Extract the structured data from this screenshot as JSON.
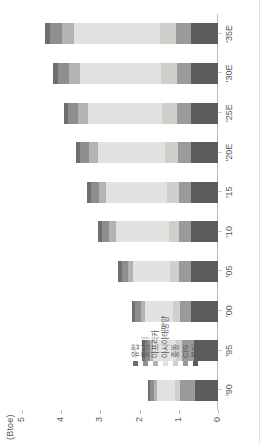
{
  "axis": {
    "unit_label": "(Btoe)",
    "y_ticks": [
      "5",
      "4",
      "3",
      "2",
      "1",
      "0"
    ],
    "y_min": 0,
    "y_max": 5
  },
  "legend": {
    "items": [
      {
        "label": "유럽",
        "color": "#6f6f71"
      },
      {
        "label": "중남미",
        "color": "#8e8e90"
      },
      {
        "label": "아프리카",
        "color": "#b3b3b5"
      },
      {
        "label": "아시아태평양",
        "color": "#e2e2e0"
      },
      {
        "label": "중동",
        "color": "#cfcfcb"
      },
      {
        "label": "CIS",
        "color": "#9a9a9c"
      },
      {
        "label": "북미",
        "color": "#5c5c5e"
      }
    ]
  },
  "chart_data": {
    "type": "bar",
    "title": "",
    "subtitle": "",
    "xlabel": "",
    "ylabel": "(Btoe)",
    "ylim": [
      0,
      5
    ],
    "grid": false,
    "stacked": true,
    "legend_position": "inside-left",
    "categories": [
      "'90",
      "'95",
      "'00",
      "'05",
      "'10",
      "'15",
      "'20E",
      "'25E",
      "'30E",
      "'35E"
    ],
    "series": [
      {
        "name": "북미",
        "color": "#5c5c5e",
        "values": [
          0.58,
          0.62,
          0.68,
          0.7,
          0.68,
          0.68,
          0.68,
          0.7,
          0.7,
          0.7
        ]
      },
      {
        "name": "CIS",
        "color": "#9a9a9c",
        "values": [
          0.4,
          0.3,
          0.28,
          0.3,
          0.31,
          0.32,
          0.33,
          0.34,
          0.35,
          0.36
        ]
      },
      {
        "name": "중동",
        "color": "#cfcfcb",
        "values": [
          0.12,
          0.15,
          0.18,
          0.22,
          0.27,
          0.31,
          0.34,
          0.38,
          0.41,
          0.43
        ]
      },
      {
        "name": "아시아태평양",
        "color": "#e2e2e0",
        "values": [
          0.45,
          0.58,
          0.72,
          0.95,
          1.35,
          1.55,
          1.72,
          1.9,
          2.05,
          2.18
        ]
      },
      {
        "name": "아프리카",
        "color": "#b3b3b5",
        "values": [
          0.08,
          0.09,
          0.11,
          0.13,
          0.16,
          0.18,
          0.21,
          0.24,
          0.28,
          0.32
        ]
      },
      {
        "name": "중남미",
        "color": "#8e8e90",
        "values": [
          0.1,
          0.12,
          0.14,
          0.16,
          0.19,
          0.21,
          0.23,
          0.26,
          0.28,
          0.3
        ]
      },
      {
        "name": "유럽",
        "color": "#6f6f71",
        "values": [
          0.07,
          0.08,
          0.09,
          0.09,
          0.1,
          0.1,
          0.11,
          0.12,
          0.13,
          0.13
        ]
      }
    ],
    "totals": [
      1.8,
      1.94,
      2.2,
      2.55,
      3.06,
      3.35,
      3.62,
      3.94,
      4.2,
      4.42
    ]
  }
}
